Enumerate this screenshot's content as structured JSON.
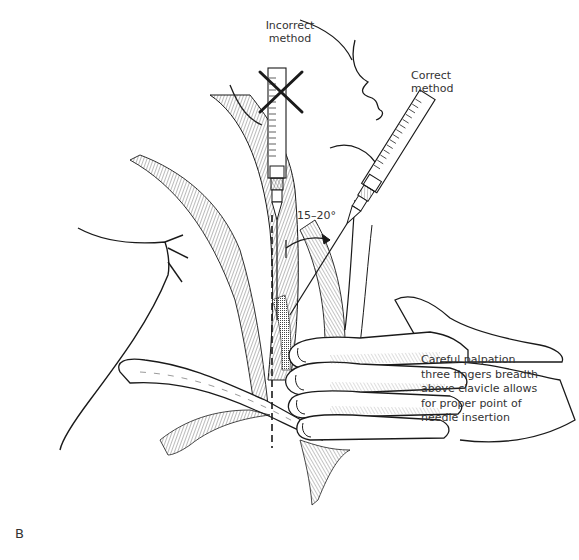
{
  "figure": {
    "panel_label": "B",
    "labels": {
      "incorrect_method": "Incorrect\nmethod",
      "correct_method": "Correct\nmethod",
      "angle": "15–20°",
      "palpation_note": "Careful palpation\nthree fingers breadth\nabove clavicle allows\nfor proper point of\nneedle insertion"
    },
    "marks": {
      "incorrect_marker": "X"
    },
    "colors": {
      "line": "#1a1a1a",
      "hatch": "#4a4a4a",
      "background": "#ffffff"
    }
  }
}
